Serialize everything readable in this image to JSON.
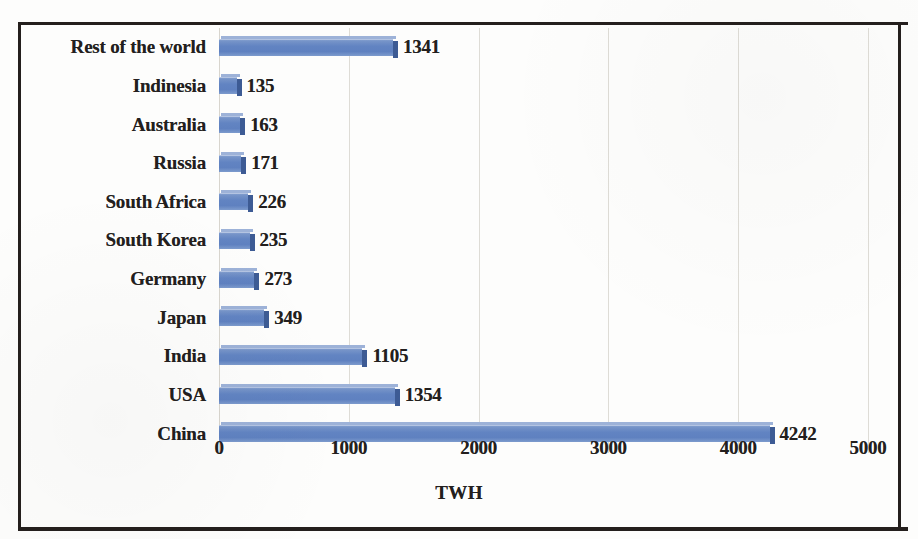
{
  "chart_data": {
    "type": "bar",
    "orientation": "horizontal",
    "title": "",
    "xlabel": "TWH",
    "ylabel": "",
    "xlim": [
      0,
      5000
    ],
    "xticks": [
      "0",
      "1000",
      "2000",
      "3000",
      "4000",
      "5000"
    ],
    "grid": true,
    "legend": false,
    "bar_color": "#6284c2",
    "bar_edge_color": "#3d5b94",
    "categories": [
      "Rest of the world",
      "Indinesia",
      "Australia",
      "Russia",
      "South Africa",
      "South Korea",
      "Germany",
      "Japan",
      "India",
      "USA",
      "China"
    ],
    "values": [
      1341,
      135,
      163,
      171,
      226,
      235,
      273,
      349,
      1105,
      1354,
      4242
    ],
    "data_labels": [
      "1341",
      "135",
      "163",
      "171",
      "226",
      "235",
      "273",
      "349",
      "1105",
      "1354",
      "4242"
    ]
  }
}
